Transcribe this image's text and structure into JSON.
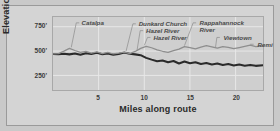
{
  "chart_data": {
    "type": "line",
    "title": "",
    "xlabel": "Miles along route",
    "ylabel": "Elevation",
    "xlim": [
      0,
      23
    ],
    "ylim": [
      100,
      850
    ],
    "grid": true,
    "legend": "none",
    "xticks": [
      "5",
      "10",
      "15",
      "20"
    ],
    "xtick_values": [
      5,
      10,
      15,
      20
    ],
    "yticks": [
      "750'",
      "500'",
      "250'"
    ],
    "ytick_values": [
      750,
      500,
      250
    ],
    "series": [
      {
        "name": "route-profile-dark",
        "color": "#2b2b2b",
        "x": [
          0.0,
          0.6,
          1.2,
          1.8,
          2.4,
          3.0,
          3.6,
          4.2,
          4.8,
          5.4,
          6.0,
          6.6,
          7.2,
          7.8,
          8.4,
          9.0,
          9.6,
          10.2,
          10.8,
          11.4,
          12.0,
          12.6,
          13.2,
          13.8,
          14.4,
          15.0,
          15.6,
          16.2,
          16.8,
          17.4,
          18.0,
          18.6,
          19.2,
          19.8,
          20.4,
          21.0,
          21.6,
          22.2,
          23.0
        ],
        "values": [
          470,
          468,
          472,
          466,
          474,
          462,
          478,
          470,
          482,
          468,
          474,
          462,
          470,
          484,
          472,
          466,
          458,
          430,
          412,
          396,
          404,
          386,
          398,
          372,
          392,
          374,
          386,
          368,
          378,
          362,
          372,
          356,
          366,
          352,
          362,
          350,
          358,
          348,
          354
        ]
      },
      {
        "name": "route-profile-light",
        "color": "#8e8e8e",
        "x": [
          0.0,
          0.6,
          1.2,
          1.8,
          2.4,
          3.0,
          3.6,
          4.2,
          4.8,
          5.4,
          6.0,
          6.6,
          7.2,
          7.8,
          8.4,
          9.0,
          9.6,
          10.2,
          10.8,
          11.4,
          12.0,
          12.6,
          13.2,
          13.8,
          14.4,
          15.0,
          15.6,
          16.2,
          16.8,
          17.4,
          18.0,
          18.6,
          19.2,
          19.8,
          20.4,
          21.0,
          21.6,
          22.2,
          23.0
        ],
        "values": [
          470,
          474,
          500,
          528,
          506,
          486,
          496,
          478,
          492,
          474,
          486,
          470,
          478,
          488,
          474,
          496,
          528,
          548,
          534,
          512,
          498,
          486,
          504,
          520,
          546,
          536,
          522,
          540,
          556,
          544,
          530,
          546,
          538,
          524,
          536,
          548,
          560,
          546,
          552
        ]
      }
    ],
    "annotations": [
      {
        "label": "Catalpa",
        "x_mile": 3.2,
        "leader_to_mile": 2.0
      },
      {
        "label": "Dunkard Church",
        "x_mile": 9.4,
        "leader_to_mile": 8.0
      },
      {
        "label": "Hazel River",
        "x_mile": 10.2,
        "leader_to_mile": 9.2
      },
      {
        "label": "Hazel River",
        "x_mile": 11.0,
        "leader_to_mile": 10.0
      },
      {
        "label": "Rappahannock River",
        "x_mile": 16.0,
        "leader_to_mile": 14.4
      },
      {
        "label": "Viewtown",
        "x_mile": 18.6,
        "leader_to_mile": 17.8
      },
      {
        "label": "Remi",
        "x_mile": 22.3,
        "leader_to_mile": 21.6
      }
    ]
  },
  "colors": {
    "figure_background": "#d4d4d4",
    "plot_background": "#cfcfcf",
    "frame": "#a8a8a8",
    "gridline": "#e8e8e8",
    "axis_text": "#2a2a2a",
    "annotation_text": "#4a4a4a",
    "leader_line": "#8a8a8a"
  }
}
